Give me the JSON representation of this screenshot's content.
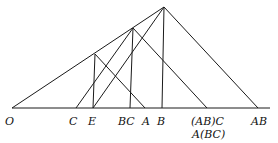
{
  "diagram": {
    "type": "geometric-construction",
    "baseline": {
      "x1": 12,
      "x2": 270,
      "y": 108
    },
    "points": {
      "O": {
        "x": 12,
        "y": 108
      },
      "P1": {
        "x": 164,
        "y": 7
      },
      "P2": {
        "x": 133,
        "y": 28
      },
      "P3": {
        "x": 95,
        "y": 54
      },
      "C": {
        "x": 76,
        "y": 108
      },
      "E": {
        "x": 93,
        "y": 108
      },
      "BC": {
        "x": 130,
        "y": 108
      },
      "A": {
        "x": 145,
        "y": 108
      },
      "B": {
        "x": 162,
        "y": 108
      },
      "ABC": {
        "x": 207,
        "y": 108
      },
      "AB": {
        "x": 258,
        "y": 108
      }
    },
    "labels": {
      "O": "O",
      "C": "C",
      "E": "E",
      "BC": "BC",
      "A": "A",
      "B": "B",
      "ABC_line1": "(AB)C",
      "ABC_line2": "A(BC)",
      "AB": "AB"
    }
  }
}
